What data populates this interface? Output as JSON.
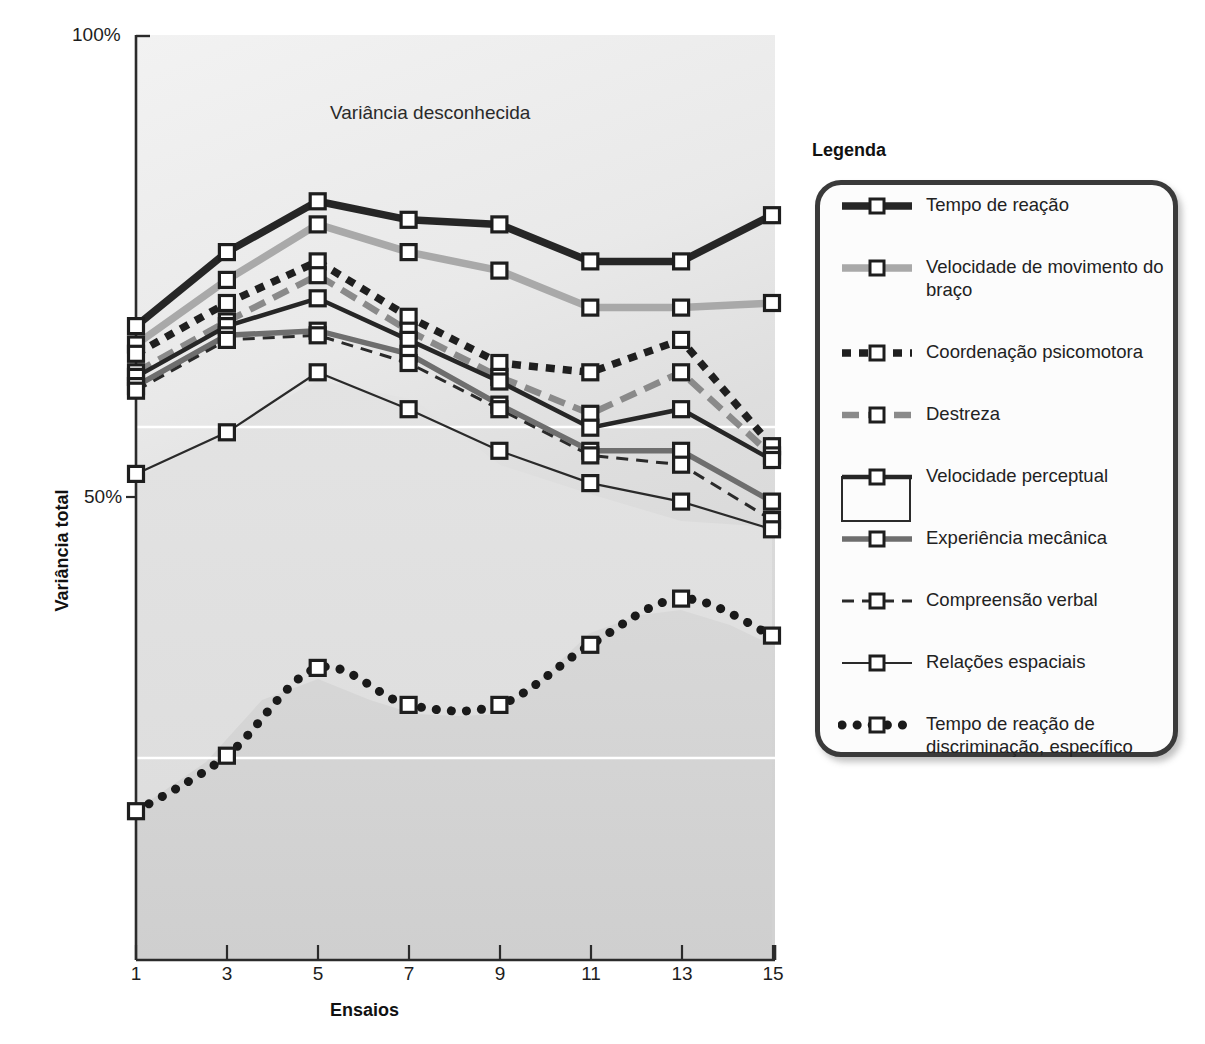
{
  "axes": {
    "y_ticks": [
      "100%",
      "50%"
    ],
    "y_label": "Variância total",
    "x_ticks": [
      "1",
      "3",
      "5",
      "7",
      "9",
      "11",
      "13",
      "15"
    ],
    "x_label": "Ensaios"
  },
  "annotation": "Variância desconhecida",
  "legend": {
    "title": "Legenda",
    "items": [
      {
        "label": "Tempo de reação",
        "style": "thick-solid",
        "color": "#262626"
      },
      {
        "label": "Velocidade de movimento do braço",
        "style": "thick-solid",
        "color": "#a9a9a9"
      },
      {
        "label": "Coordenação psicomotora",
        "style": "thick-dotted-square",
        "color": "#1f1f1f"
      },
      {
        "label": "Destreza",
        "style": "thick-dashed",
        "color": "#8a8a8a"
      },
      {
        "label": "Velocidade perceptual",
        "style": "medium-solid-box",
        "color": "#262626"
      },
      {
        "label": "Experiência mecânica",
        "style": "medium-solid",
        "color": "#6e6e6e"
      },
      {
        "label": "Compreensão verbal",
        "style": "thin-dashed",
        "color": "#2a2a2a"
      },
      {
        "label": "Relações espaciais",
        "style": "thin-solid",
        "color": "#2a2a2a"
      },
      {
        "label": "Tempo de reação de discriminação, específico",
        "style": "round-dotted",
        "color": "#1a1a1a"
      }
    ]
  },
  "chart_data": {
    "type": "line",
    "title": "",
    "subtitle": "",
    "xlabel": "Ensaios",
    "ylabel": "Variância total",
    "annotation": "Variância desconhecida",
    "x": [
      1,
      3,
      5,
      7,
      9,
      11,
      13,
      15
    ],
    "xlim": [
      1,
      15
    ],
    "ylim": [
      0,
      100
    ],
    "y_tick_values": [
      50,
      100
    ],
    "y_tick_labels": [
      "50%",
      "100%"
    ],
    "grid": "two white horizontal gridlines",
    "legend_position": "right-outside",
    "series": [
      {
        "name": "Tempo de reação",
        "style": "thick-solid",
        "color": "#262626",
        "values": [
          68.5,
          76.5,
          82.0,
          80.0,
          79.5,
          75.5,
          75.5,
          80.5
        ]
      },
      {
        "name": "Velocidade de movimento do braço",
        "style": "thick-solid",
        "color": "#a9a9a9",
        "values": [
          66.5,
          73.5,
          79.5,
          76.5,
          74.5,
          70.5,
          70.5,
          71.0
        ]
      },
      {
        "name": "Coordenação psicomotora",
        "style": "thick-dotted-square",
        "color": "#1f1f1f",
        "values": [
          65.5,
          71.0,
          75.5,
          69.5,
          64.5,
          63.5,
          67.0,
          55.5
        ]
      },
      {
        "name": "Destreza",
        "style": "thick-dashed",
        "color": "#8a8a8a",
        "values": [
          63.5,
          69.0,
          74.0,
          68.0,
          63.0,
          59.0,
          63.5,
          54.5
        ]
      },
      {
        "name": "Velocidade perceptual",
        "style": "medium-solid-box",
        "color": "#262626",
        "values": [
          63.0,
          68.5,
          71.5,
          67.0,
          62.5,
          57.5,
          59.5,
          54.0
        ]
      },
      {
        "name": "Experiência mecânica",
        "style": "medium-solid",
        "color": "#6e6e6e",
        "values": [
          62.0,
          67.5,
          68.0,
          65.5,
          60.0,
          55.0,
          55.0,
          49.5
        ]
      },
      {
        "name": "Compreensão verbal",
        "style": "thin-dashed",
        "color": "#2a2a2a",
        "values": [
          61.5,
          67.0,
          67.5,
          64.5,
          59.5,
          54.5,
          53.5,
          47.5
        ]
      },
      {
        "name": "Relações espaciais",
        "style": "thin-solid",
        "color": "#2a2a2a",
        "values": [
          52.5,
          57.0,
          63.5,
          59.5,
          55.0,
          51.5,
          49.5,
          46.5
        ]
      },
      {
        "name": "Tempo de reação de discriminação, específico",
        "style": "round-dotted",
        "color": "#1a1a1a",
        "values": [
          16.0,
          22.0,
          31.5,
          27.5,
          27.5,
          34.0,
          39.0,
          35.0
        ]
      }
    ]
  }
}
